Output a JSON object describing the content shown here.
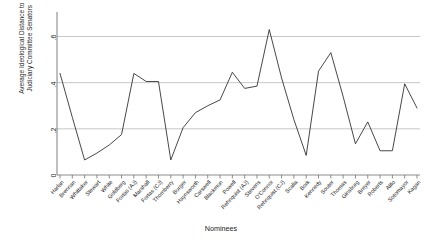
{
  "chart_data": {
    "type": "line",
    "title": "",
    "xlabel": "Nominees",
    "ylabel": "Average Ideological Distance to\nJudiciary Committee Senators",
    "ylim": [
      0,
      0.68
    ],
    "yticks": [
      0,
      0.2,
      0.4,
      0.6
    ],
    "ytick_labels": [
      "0",
      ".2",
      ".4",
      ".6"
    ],
    "grid": "horizontal",
    "legend": "none",
    "line_color": "#333333",
    "categories": [
      "Harlan",
      "Brennan",
      "Whittaker",
      "Stewart",
      "White",
      "Goldberg",
      "Fortas (AJ)",
      "Marshall",
      "Fortas (CJ)",
      "Thornberry",
      "Burger",
      "Haynsworth",
      "Carswell",
      "Blackmun",
      "Powell",
      "Rehnquist (AJ)",
      "Stevens",
      "O'Connor",
      "Rehnquist (CJ)",
      "Scalia",
      "Bork",
      "Kennedy",
      "Souter",
      "Thomas",
      "Ginsburg",
      "Breyer",
      "Roberts",
      "Alito",
      "Sotomayor",
      "Kagan"
    ],
    "values": [
      0.44,
      0.25,
      0.065,
      0.095,
      0.13,
      0.175,
      0.44,
      0.405,
      0.405,
      0.065,
      0.205,
      0.27,
      0.3,
      0.325,
      0.445,
      0.375,
      0.385,
      0.63,
      0.42,
      0.24,
      0.085,
      0.45,
      0.53,
      0.34,
      0.135,
      0.23,
      0.105,
      0.105,
      0.395,
      0.29
    ]
  }
}
